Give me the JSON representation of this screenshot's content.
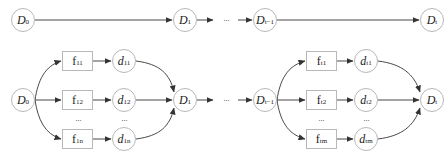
{
  "diagram": {
    "top_row": {
      "nodes": [
        {
          "id": "D0",
          "base": "D",
          "sub": "0"
        },
        {
          "id": "D1",
          "base": "D",
          "sub": "1"
        },
        {
          "id": "Dt-1",
          "base": "D",
          "sub": "t−1"
        },
        {
          "id": "Dt",
          "base": "D",
          "sub": "t"
        }
      ],
      "ellipsis": "···"
    },
    "bottom_row": {
      "stage1": {
        "source": {
          "base": "D",
          "sub": "0"
        },
        "functions": [
          {
            "base": "f",
            "sub": "11"
          },
          {
            "base": "f",
            "sub": "12"
          },
          {
            "base": "f",
            "sub": "1n"
          }
        ],
        "outputs": [
          {
            "base": "d",
            "sub": "11"
          },
          {
            "base": "d",
            "sub": "12"
          },
          {
            "base": "d",
            "sub": "1n"
          }
        ],
        "target": {
          "base": "D",
          "sub": "1"
        },
        "ellipsis": "···"
      },
      "middle_ellipsis": "···",
      "stage_t": {
        "source": {
          "base": "D",
          "sub": "t−1"
        },
        "functions": [
          {
            "base": "f",
            "sub": "t1"
          },
          {
            "base": "f",
            "sub": "t2"
          },
          {
            "base": "f",
            "sub": "tm"
          }
        ],
        "outputs": [
          {
            "base": "d",
            "sub": "t1"
          },
          {
            "base": "d",
            "sub": "t2"
          },
          {
            "base": "d",
            "sub": "tm"
          }
        ],
        "target": {
          "base": "D",
          "sub": "t"
        },
        "ellipsis": "···"
      }
    },
    "colors": {
      "stroke": "#333333",
      "node_border": "#b8b8b8"
    }
  }
}
